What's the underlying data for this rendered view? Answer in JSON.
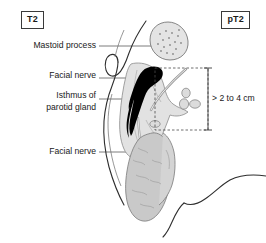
{
  "diagram": {
    "title_left_badge": "T2",
    "title_right_badge": "pT2",
    "measurement": "> 2 to 4 cm",
    "labels": {
      "mastoid_process": "Mastoid process",
      "facial_nerve_upper": "Facial nerve",
      "isthmus_of_parotid_gland": "Isthmus of\nparotid gland",
      "facial_nerve_lower": "Facial nerve"
    },
    "colors": {
      "tumor": "#000000",
      "gland_light": "#e9e9e9",
      "gland_mid": "#cfcfcf",
      "gland_dark": "#bdbdbd",
      "outline": "#3a3a3a",
      "leader_line": "#4a4a4a",
      "background": "#ffffff"
    },
    "structures": [
      "auricle-outline",
      "mastoid-process-oval",
      "tumor-mass",
      "parotid-gland",
      "lymph-nodes",
      "submandibular-gland",
      "mandible-contour",
      "measurement-bracket"
    ]
  }
}
